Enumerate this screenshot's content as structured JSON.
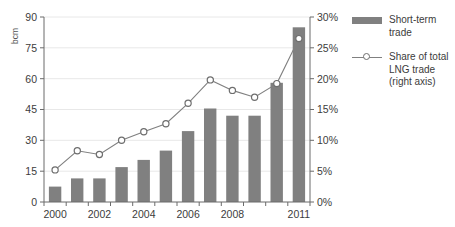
{
  "chart_data": {
    "type": "bar",
    "title": "",
    "subtitle": "",
    "xlabel": "",
    "ylabel": "bcm",
    "y2label": "",
    "categories": [
      "2000",
      "2001",
      "2002",
      "2003",
      "2004",
      "2005",
      "2006",
      "2007",
      "2008",
      "2009",
      "2010",
      "2011"
    ],
    "xtick_labels": [
      "2000",
      "",
      "2002",
      "",
      "2004",
      "",
      "2006",
      "",
      "2008",
      "",
      "",
      "2011"
    ],
    "ylim": [
      0,
      90
    ],
    "yticks": [
      0,
      15,
      30,
      45,
      60,
      75,
      90
    ],
    "ytick_labels": [
      "0",
      "15",
      "30",
      "45",
      "60",
      "75",
      "90"
    ],
    "y2lim": [
      0,
      30
    ],
    "y2ticks": [
      0,
      5,
      10,
      15,
      20,
      25,
      30
    ],
    "y2tick_labels": [
      "0%",
      "5%",
      "10%",
      "15%",
      "20%",
      "25%",
      "30%"
    ],
    "grid": true,
    "legend_position": "right",
    "series": [
      {
        "name": "Short-term trade",
        "type": "bar",
        "axis": "left",
        "color": "#808080",
        "values": [
          7.5,
          11.5,
          11.5,
          17,
          20.5,
          25,
          34.5,
          45.5,
          42,
          42,
          58,
          85
        ]
      },
      {
        "name": "Share of total LNG trade (right axis)",
        "type": "line",
        "axis": "right",
        "color": "#808080",
        "marker": "circle-open",
        "values": [
          5.2,
          8.3,
          7.7,
          10.0,
          11.4,
          12.7,
          16.0,
          19.8,
          18.1,
          17.0,
          19.2,
          26.5
        ]
      }
    ]
  },
  "legend": {
    "items": [
      {
        "label": "Short-term\ntrade",
        "key": "bar-swatch"
      },
      {
        "label": "Share of total\nLNG trade\n(right axis)",
        "key": "line-marker"
      }
    ]
  },
  "axes": {
    "left_title": "bcm"
  }
}
